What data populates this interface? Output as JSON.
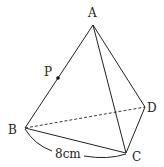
{
  "figure": {
    "type": "tetrahedron",
    "vertices": {
      "A": {
        "label": "A",
        "x": 93,
        "y": 25,
        "lx": 92,
        "ly": 17
      },
      "B": {
        "label": "B",
        "x": 25,
        "y": 128,
        "lx": 14,
        "ly": 134
      },
      "C": {
        "label": "C",
        "x": 126,
        "y": 153,
        "lx": 138,
        "ly": 161
      },
      "D": {
        "label": "D",
        "x": 145,
        "y": 107,
        "lx": 152,
        "ly": 112
      },
      "P": {
        "label": "P",
        "x": 58,
        "y": 78,
        "lx": 49,
        "ly": 76
      }
    },
    "edges_solid": [
      "AB",
      "AC",
      "AD",
      "BC",
      "CD"
    ],
    "edges_hidden": [
      "BD"
    ],
    "point_on_edge": {
      "point": "P",
      "edge": "AB"
    },
    "measurement": {
      "text": "8cm",
      "from": "B",
      "to": "C",
      "lx": 70,
      "ly": 157
    }
  }
}
